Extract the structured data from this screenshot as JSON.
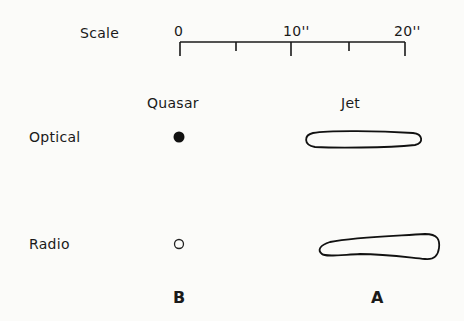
{
  "scale": {
    "title": "Scale",
    "ticks": [
      "0",
      "10''",
      "20''"
    ],
    "unit": "arcseconds",
    "range": [
      0,
      20
    ]
  },
  "columns": {
    "quasar": "Quasar",
    "jet": "Jet"
  },
  "rows": {
    "optical": "Optical",
    "radio": "Radio"
  },
  "footer": {
    "quasar_letter": "B",
    "jet_letter": "A"
  },
  "symbols": {
    "optical_quasar": "filled-circle",
    "radio_quasar": "open-circle",
    "optical_jet": "thin-elongated-contour",
    "radio_jet": "tapered-elongated-contour"
  }
}
